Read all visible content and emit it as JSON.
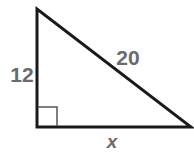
{
  "diagram": {
    "type": "right-triangle",
    "vertices": {
      "top": [
        37,
        9
      ],
      "right_angle": [
        37,
        127
      ],
      "right": [
        191,
        127
      ]
    },
    "right_angle_marker": {
      "size": 20
    },
    "labels": {
      "vertical_leg": "12",
      "hypotenuse": "20",
      "horizontal_leg": "x"
    },
    "colors": {
      "stroke": "#1a1a1a",
      "label": "#6b6b6b",
      "marker": "#555555"
    }
  }
}
